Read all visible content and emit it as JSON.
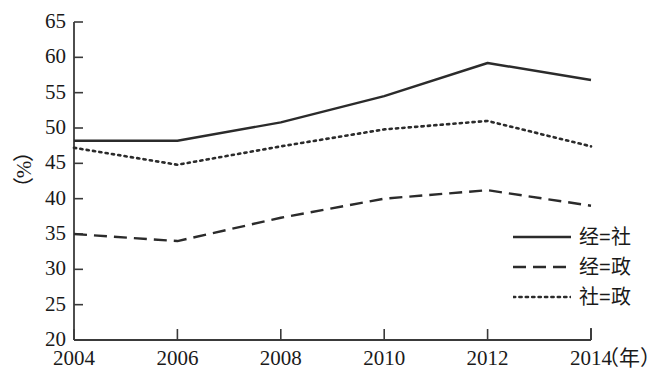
{
  "chart_data": {
    "type": "line",
    "title": "",
    "xlabel": "（年）",
    "ylabel": "（%）",
    "categories": [
      "2004",
      "2006",
      "2008",
      "2010",
      "2012",
      "2014"
    ],
    "x": [
      2004,
      2006,
      2008,
      2010,
      2012,
      2014
    ],
    "xlim": [
      2004,
      2014
    ],
    "ylim": [
      20,
      65
    ],
    "yticks": [
      20,
      25,
      30,
      35,
      40,
      45,
      50,
      55,
      60,
      65
    ],
    "grid": false,
    "legend_position": "lower-right",
    "series": [
      {
        "name": "经=社",
        "style": "solid",
        "color": "#2b2b2b",
        "values": [
          48.2,
          48.2,
          50.8,
          54.5,
          59.2,
          56.8
        ]
      },
      {
        "name": "经=政",
        "style": "dashed",
        "color": "#2b2b2b",
        "values": [
          35.0,
          34.0,
          37.3,
          40.0,
          41.2,
          39.0
        ]
      },
      {
        "name": "社=政",
        "style": "dotted",
        "color": "#2b2b2b",
        "values": [
          47.2,
          44.8,
          47.4,
          49.8,
          51.0,
          47.4
        ]
      }
    ]
  },
  "axes": {
    "y_tick_labels": [
      "65",
      "60",
      "55",
      "50",
      "45",
      "40",
      "35",
      "30",
      "25",
      "20"
    ],
    "x_tick_labels": [
      "2004",
      "2006",
      "2008",
      "2010",
      "2012",
      "2014"
    ],
    "y_axis_title": "（%）",
    "x_axis_unit": "（年）"
  },
  "legend": {
    "items": [
      {
        "label": "经=社",
        "style": "solid"
      },
      {
        "label": "经=政",
        "style": "dashed"
      },
      {
        "label": "社=政",
        "style": "dotted"
      }
    ]
  }
}
